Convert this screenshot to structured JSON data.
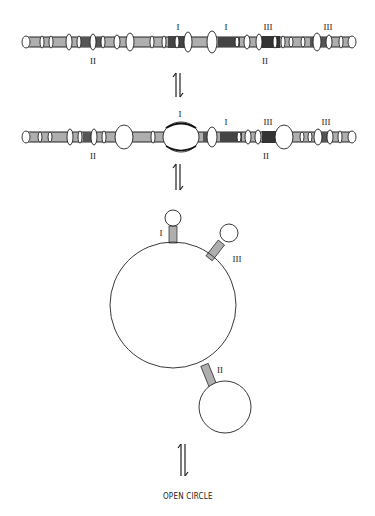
{
  "figure": {
    "stage1": {
      "labels": [
        {
          "text": "I",
          "x": 178,
          "y": 30
        },
        {
          "text": "I",
          "x": 226,
          "y": 30
        },
        {
          "text": "III",
          "x": 268,
          "y": 30
        },
        {
          "text": "III",
          "x": 328,
          "y": 30
        },
        {
          "text": "II",
          "x": 93,
          "y": 64
        },
        {
          "text": "II",
          "x": 265,
          "y": 64
        }
      ]
    },
    "stage2": {
      "labels": [
        {
          "text": "I",
          "x": 180,
          "y": 117
        },
        {
          "text": "I",
          "x": 226,
          "y": 125
        },
        {
          "text": "III",
          "x": 268,
          "y": 125
        },
        {
          "text": "III",
          "x": 326,
          "y": 125
        },
        {
          "text": "II",
          "x": 93,
          "y": 159
        },
        {
          "text": "II",
          "x": 266,
          "y": 159
        }
      ]
    },
    "stage3": {
      "labels": [
        {
          "text": "I",
          "x": 161,
          "y": 236
        },
        {
          "text": "III",
          "x": 237,
          "y": 262
        },
        {
          "text": "II",
          "x": 220,
          "y": 373
        }
      ]
    },
    "caption": "OPEN CIRCLE"
  }
}
